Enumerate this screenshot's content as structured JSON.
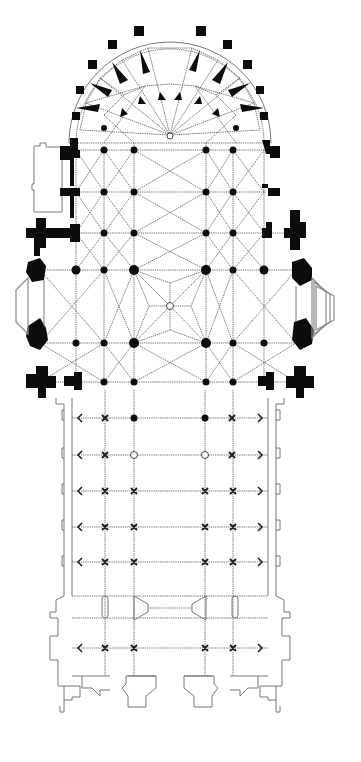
{
  "diagram": {
    "type": "architectural-floor-plan",
    "colors": {
      "background": "#ffffff",
      "solid_masonry": "#0c0c0c",
      "outline": "#777777",
      "rib_lines": "#555555",
      "hatched_chapel": "#8a8a8a"
    },
    "regions": [
      {
        "id": "apse",
        "label": "chevet / apse with radiating chapels"
      },
      {
        "id": "choir",
        "label": "choir bays"
      },
      {
        "id": "transept",
        "label": "transept crossing with octagonal end chapels"
      },
      {
        "id": "nave",
        "label": "nave with double aisles"
      },
      {
        "id": "west_front",
        "label": "west facade with two towers and portals"
      }
    ],
    "nave_row_markers": [
      "pier",
      "cross",
      "cross",
      "cross",
      "cross",
      "cross",
      "cross"
    ],
    "nave_rows_y": [
      418,
      455,
      491,
      527,
      562,
      648
    ],
    "pier_columns_x": [
      105,
      134,
      205,
      233
    ],
    "aisle_walls_x": [
      64,
      268
    ]
  }
}
